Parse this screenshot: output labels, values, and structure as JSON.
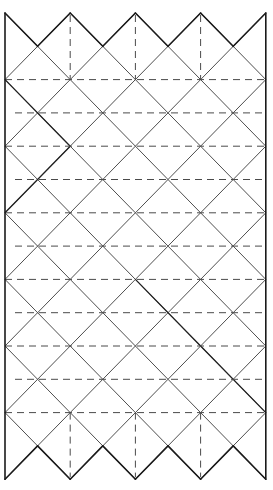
{
  "diagram": {
    "type": "crease-pattern",
    "colors": {
      "background": "#ffffff",
      "line": "#1a1a1a",
      "dashed": "#4a4a4a"
    },
    "grid": {
      "x0": 5,
      "y0": 13,
      "dx": 32.6,
      "dy": 33.3,
      "columns": 8,
      "rows": 14
    },
    "top_zigzag": {
      "peaks_at_columns": [
        0,
        2,
        4,
        6,
        8
      ],
      "valleys_at_columns": [
        1,
        3,
        5,
        7
      ]
    },
    "bottom_zigzag": {
      "points_at_columns": [
        0,
        2,
        4,
        6,
        8
      ],
      "notches_at_columns": [
        1,
        3,
        5,
        7
      ]
    },
    "dashed_horizontal_rows": [
      2,
      3,
      4,
      5,
      6,
      7,
      8,
      9,
      10,
      11,
      12
    ],
    "dashed_vertical": {
      "columns": [
        2,
        4,
        6
      ],
      "top_span_rows": [
        0,
        2
      ],
      "bottom_span_rows": [
        12,
        14
      ]
    },
    "bold_diagonals": [
      {
        "from": [
          0,
          2
        ],
        "to": [
          2,
          4
        ]
      },
      {
        "from": [
          2,
          4
        ],
        "to": [
          0,
          6
        ]
      },
      {
        "from": [
          4,
          8
        ],
        "to": [
          6,
          10
        ]
      },
      {
        "from": [
          6,
          10
        ],
        "to": [
          8,
          12
        ]
      }
    ]
  }
}
